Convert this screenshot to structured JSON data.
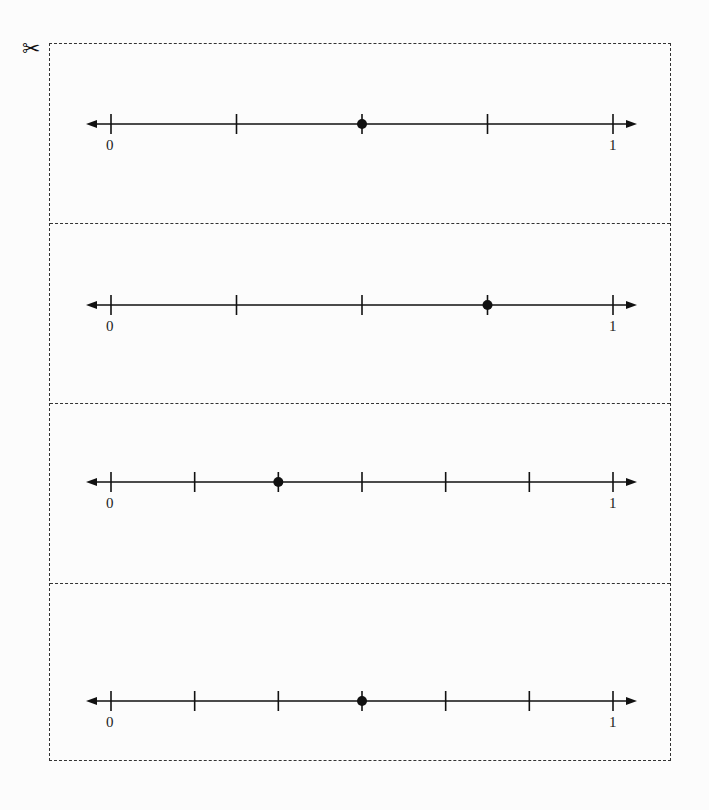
{
  "scissors_icon": "✂",
  "chart_data": {
    "type": "number-line",
    "title": "",
    "lines": [
      {
        "start_label": "0",
        "end_label": "1",
        "divisions": 4,
        "point_index": 2,
        "point_value": "2/4"
      },
      {
        "start_label": "0",
        "end_label": "1",
        "divisions": 4,
        "point_index": 3,
        "point_value": "3/4"
      },
      {
        "start_label": "0",
        "end_label": "1",
        "divisions": 6,
        "point_index": 2,
        "point_value": "2/6"
      },
      {
        "start_label": "0",
        "end_label": "1",
        "divisions": 6,
        "point_index": 3,
        "point_value": "3/6"
      }
    ]
  },
  "panels": [
    {
      "start": "0",
      "end": "1"
    },
    {
      "start": "0",
      "end": "1"
    },
    {
      "start": "0",
      "end": "1"
    },
    {
      "start": "0",
      "end": "1"
    }
  ]
}
